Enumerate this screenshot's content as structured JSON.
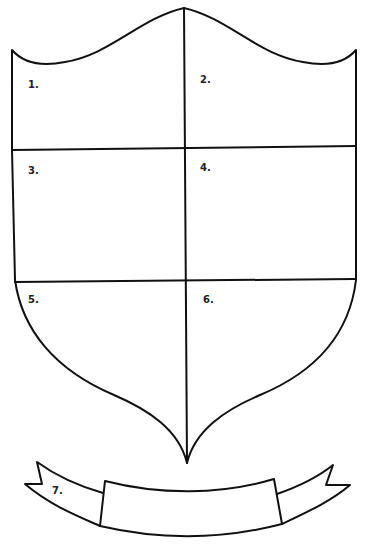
{
  "colors": {
    "ink": "#111111",
    "background": "#ffffff"
  },
  "sections": [
    {
      "id": 1,
      "label": "1."
    },
    {
      "id": 2,
      "label": "2."
    },
    {
      "id": 3,
      "label": "3."
    },
    {
      "id": 4,
      "label": "4."
    },
    {
      "id": 5,
      "label": "5."
    },
    {
      "id": 6,
      "label": "6."
    },
    {
      "id": 7,
      "label": "7."
    }
  ]
}
